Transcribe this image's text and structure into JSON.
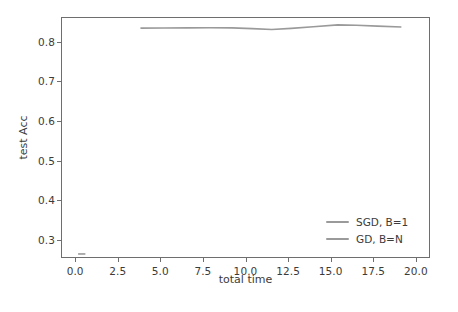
{
  "chart_data": {
    "type": "line",
    "title": "",
    "xlabel": "total time",
    "ylabel": "test Acc",
    "xlim": [
      -0.83,
      20.83
    ],
    "ylim": [
      0.2548,
      0.8622
    ],
    "grid": false,
    "legend_position": "lower right",
    "legend_frame": false,
    "xticks": [
      0.0,
      2.5,
      5.0,
      7.5,
      10.0,
      12.5,
      15.0,
      17.5,
      20.0
    ],
    "xtick_labels": [
      "0.0",
      "2.5",
      "5.0",
      "7.5",
      "10.0",
      "12.5",
      "15.0",
      "17.5",
      "20.0"
    ],
    "yticks": [
      0.3,
      0.4,
      0.5,
      0.6,
      0.7,
      0.8
    ],
    "ytick_labels": [
      "0.3",
      "0.4",
      "0.5",
      "0.6",
      "0.7",
      "0.8"
    ],
    "series": [
      {
        "name": "SGD, B=1",
        "color": "#9a9a9a",
        "x": [
          0.12,
          0.55
        ],
        "y": [
          0.2625,
          0.2625
        ]
      },
      {
        "name": "GD, B=N",
        "color": "#9a9a9a",
        "x": [
          3.8,
          5.2,
          6.6,
          7.9,
          9.2,
          10.4,
          11.55,
          12.7,
          14.0,
          15.45,
          16.55,
          17.8,
          19.2
        ],
        "y": [
          0.8365,
          0.8368,
          0.8372,
          0.8376,
          0.8372,
          0.8352,
          0.833,
          0.8358,
          0.8398,
          0.8448,
          0.8438,
          0.8416,
          0.8395
        ]
      }
    ]
  },
  "legend": {
    "items": [
      {
        "label": "SGD, B=1",
        "color": "#9a9a9a"
      },
      {
        "label": "GD, B=N",
        "color": "#9a9a9a"
      }
    ]
  },
  "axes": {
    "xlabel": "total time",
    "ylabel": "test Acc",
    "frame_color": "#6e6e6e",
    "tick_color": "#3b3b3b"
  }
}
